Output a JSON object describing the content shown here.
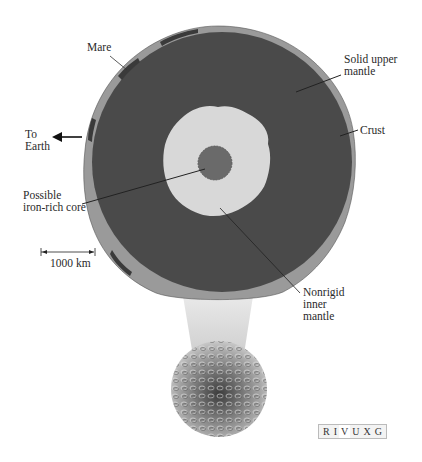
{
  "diagram": {
    "labels": {
      "mare": "Mare",
      "to_earth": "To\nEarth",
      "solid_upper_mantle": "Solid upper\nmantle",
      "crust": "Crust",
      "core": "Possible\niron-rich core",
      "scale": "1000 km",
      "inner_mantle": "Nonrigid\ninner\nmantle"
    },
    "wavelength_bar": {
      "letters": [
        "R",
        "I",
        "V",
        "U",
        "X",
        "G"
      ],
      "highlighted": "V"
    },
    "colors": {
      "upper_mantle": "#4a4a4a",
      "crust": "#9a9a9a",
      "mare": "#3a3a3a",
      "inner_mantle": "#d8d8d8",
      "core": "#6a6a6a",
      "background": "#ffffff"
    }
  }
}
